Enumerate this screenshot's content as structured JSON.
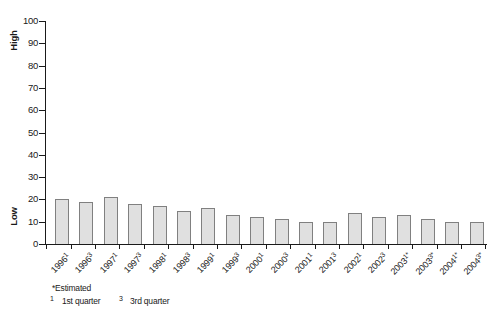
{
  "chart_data": {
    "type": "bar",
    "title": "",
    "xlabel": "",
    "ylabel_top": "High",
    "ylabel_bottom": "Low",
    "ylim": [
      0,
      100
    ],
    "y_ticks": [
      0,
      10,
      20,
      30,
      40,
      50,
      60,
      70,
      80,
      90,
      100
    ],
    "grid": false,
    "legend": "none",
    "categories": [
      "1996¹",
      "1996³",
      "1997¹",
      "1997³",
      "1998¹",
      "1998³",
      "1999¹",
      "1999³",
      "2000¹",
      "2000³",
      "2001¹",
      "2001³",
      "2002¹",
      "2002³",
      "2003¹*",
      "2003³*",
      "2004¹*",
      "2004³*"
    ],
    "values": [
      20,
      19,
      21,
      18,
      17,
      15,
      16,
      13,
      12,
      11,
      10,
      10,
      14,
      12,
      13,
      11,
      10,
      10
    ],
    "bar_fill_color": "#e0e0e0",
    "bar_border_color": "#808080",
    "axis_color": "#1a1a1a"
  },
  "footnotes": {
    "estimated": "*Estimated",
    "first_quarter_marker": "1",
    "first_quarter_text": "1st quarter",
    "third_quarter_marker": "3",
    "third_quarter_text": "3rd quarter"
  }
}
